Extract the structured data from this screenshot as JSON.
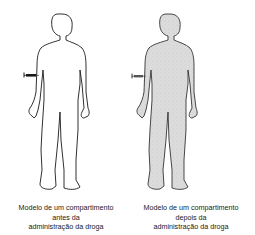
{
  "figures": [
    {
      "id": "before",
      "caption": [
        "Modelo de um compartimento",
        "antes da",
        "administração da droga"
      ],
      "body_fill": "#ffffff",
      "outline_color": "#1a1a1a"
    },
    {
      "id": "after",
      "caption": [
        "Modelo de um compartimento",
        "depois da",
        "administração da droga"
      ],
      "body_fill": "#d9d9d9",
      "outline_color": "#333333"
    }
  ],
  "icons": {
    "syringe": "syringe-icon",
    "body": "human-body-silhouette"
  }
}
